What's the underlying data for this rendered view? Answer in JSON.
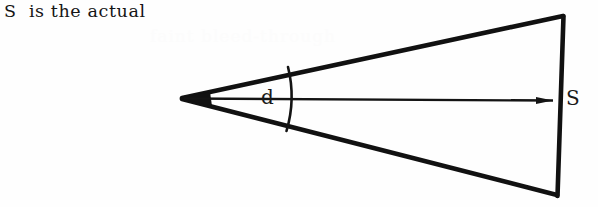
{
  "page": {
    "width": 598,
    "height": 207,
    "background_color": "#fefefe",
    "ink_color": "#111111"
  },
  "caption": {
    "text": "S  is the actual"
  },
  "ghost": {
    "text": "faint bleed-through"
  },
  "figure": {
    "labels": {
      "angle": "d",
      "base": "S"
    },
    "geometry": {
      "apex": [
        182,
        98
      ],
      "top_right": [
        563,
        16
      ],
      "bottom_right": [
        557,
        195
      ],
      "axis_start": [
        182,
        98
      ],
      "axis_end": [
        554,
        100
      ],
      "arc_x": 291,
      "arc_top_y": 67,
      "arc_bottom_y": 131
    }
  }
}
